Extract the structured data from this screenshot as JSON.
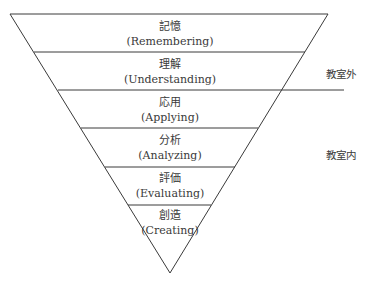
{
  "diagram": {
    "type": "inverted-pyramid",
    "levels": [
      {
        "jp": "記憶",
        "en": "(Remembering)"
      },
      {
        "jp": "理解",
        "en": "(Understanding)"
      },
      {
        "jp": "応用",
        "en": "(Applying)"
      },
      {
        "jp": "分析",
        "en": "(Analyzing)"
      },
      {
        "jp": "評価",
        "en": "(Evaluating)"
      },
      {
        "jp": "創造",
        "en": "(Creating)"
      }
    ],
    "side_labels": {
      "outside": "教室外",
      "inside": "教室内"
    },
    "line_color": "#333333"
  }
}
